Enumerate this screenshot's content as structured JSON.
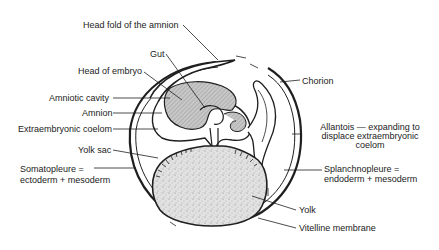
{
  "figure": {
    "type": "anatomical-diagram",
    "colors": {
      "line": "#1f1f1f",
      "embryo_fill": "#bdbdbd",
      "yolk_fill": "#d9d9d9",
      "background": "#ffffff"
    }
  },
  "labels": {
    "head_fold": "Head fold of the amnion",
    "gut": "Gut",
    "head_embryo": "Head of embryo",
    "amniotic_cavity": "Amniotic cavity",
    "amnion": "Amnion",
    "extraembryonic_coelom": "Extraembryonic coelom",
    "yolk_sac": "Yolk sac",
    "somatopleure_1": "Somatopleure =",
    "somatopleure_2": "ectoderm + mesoderm",
    "chorion": "Chorion",
    "allantois_1": "Allantois — expanding to",
    "allantois_2": "displace extraembryonic",
    "allantois_3": "coelom",
    "splanchnopleure_1": "Splanchnopleure =",
    "splanchnopleure_2": "endoderm + mesoderm",
    "yolk": "Yolk",
    "vitelline": "Vitelline membrane"
  }
}
